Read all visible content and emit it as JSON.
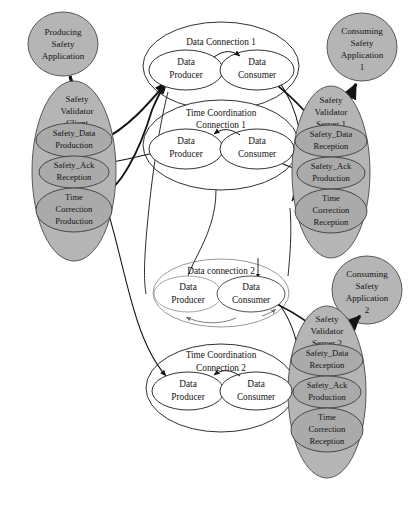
{
  "diagram": {
    "type": "node-link-diagram",
    "colors": {
      "app_fill": "#b5b5b5",
      "validator_fill": "#b5b5b5",
      "inner_fill": "#aaaaaa",
      "connection_fill": "#ffffff",
      "connection_stroke": "#1a1a1a",
      "light_stroke": "#9a9a9a",
      "arrow_stroke": "#141414",
      "background": "#ffffff"
    },
    "applications": [
      {
        "id": "producing-app",
        "lines": [
          "Producing",
          "Safety",
          "Application"
        ]
      },
      {
        "id": "consuming-app-1",
        "lines": [
          "Consuming",
          "Safety",
          "Application",
          "1"
        ]
      },
      {
        "id": "consuming-app-2",
        "lines": [
          "Consuming",
          "Safety",
          "Application",
          "2"
        ]
      }
    ],
    "validators": [
      {
        "id": "safety-validator-client",
        "lines": [
          "Safety",
          "Validator",
          "Client"
        ],
        "slots": [
          {
            "id": "safety-data-production",
            "lines": [
              "Safety_Data",
              "Production"
            ]
          },
          {
            "id": "safety-ack-reception",
            "lines": [
              "Safety_Ack",
              "Reception"
            ]
          },
          {
            "id": "time-correction-production",
            "lines": [
              "Time",
              "Correction",
              "Production"
            ]
          }
        ]
      },
      {
        "id": "safety-validator-server-1",
        "lines": [
          "Safety",
          "Validator",
          "Server 1"
        ],
        "slots": [
          {
            "id": "safety-data-reception-1",
            "lines": [
              "Safety_Data",
              "Reception"
            ]
          },
          {
            "id": "safety-ack-production-1",
            "lines": [
              "Safety_Ack",
              "Production"
            ]
          },
          {
            "id": "time-correction-reception-1",
            "lines": [
              "Time",
              "Correction",
              "Reception"
            ]
          }
        ]
      },
      {
        "id": "safety-validator-server-2",
        "lines": [
          "Safety",
          "Validator",
          "Server 2"
        ],
        "slots": [
          {
            "id": "safety-data-reception-2",
            "lines": [
              "Safety_Data",
              "Reception"
            ]
          },
          {
            "id": "safety-ack-production-2",
            "lines": [
              "Safety_Ack",
              "Production"
            ]
          },
          {
            "id": "time-correction-reception-2",
            "lines": [
              "Time",
              "Correction",
              "Reception"
            ]
          }
        ]
      }
    ],
    "connections": [
      {
        "id": "data-connection-1",
        "title_lines": [
          "Data Connection 1"
        ],
        "producer_lines": [
          "Data",
          "Producer"
        ],
        "consumer_lines": [
          "Data",
          "Consumer"
        ]
      },
      {
        "id": "time-coordination-connection-1",
        "title_lines": [
          "Time Coordination",
          "Connection 1"
        ],
        "producer_lines": [
          "Data",
          "Producer"
        ],
        "consumer_lines": [
          "Data",
          "Consumer"
        ]
      },
      {
        "id": "data-connection-2",
        "title_lines": [
          "Data connection 2"
        ],
        "producer_lines": [
          "Data",
          "Producer"
        ],
        "consumer_lines": [
          "Data",
          "Consumer"
        ]
      },
      {
        "id": "time-coordination-connection-2",
        "title_lines": [
          "Time Coordination",
          "Connection 2"
        ],
        "producer_lines": [
          "Data",
          "Producer"
        ],
        "consumer_lines": [
          "Data",
          "Consumer"
        ]
      }
    ],
    "labels": {
      "producing_app_l1": "Producing",
      "producing_app_l2": "Safety",
      "producing_app_l3": "Application",
      "consuming_app1_l1": "Consuming",
      "consuming_app1_l2": "Safety",
      "consuming_app1_l3": "Application",
      "consuming_app1_l4": "1",
      "consuming_app2_l1": "Consuming",
      "consuming_app2_l2": "Safety",
      "consuming_app2_l3": "Application",
      "consuming_app2_l4": "2",
      "svc_l1": "Safety",
      "svc_l2": "Validator",
      "svc_l3": "Client",
      "svc_s1_l1": "Safety_Data",
      "svc_s1_l2": "Production",
      "svc_s2_l1": "Safety_Ack",
      "svc_s2_l2": "Reception",
      "svc_s3_l1": "Time",
      "svc_s3_l2": "Correction",
      "svc_s3_l3": "Production",
      "svs1_l1": "Safety",
      "svs1_l2": "Validator",
      "svs1_l3": "Server 1",
      "svs1_s1_l1": "Safety_Data",
      "svs1_s1_l2": "Reception",
      "svs1_s2_l1": "Safety_Ack",
      "svs1_s2_l2": "Production",
      "svs1_s3_l1": "Time",
      "svs1_s3_l2": "Correction",
      "svs1_s3_l3": "Reception",
      "svs2_l1": "Safety",
      "svs2_l2": "Validator",
      "svs2_l3": "Server 2",
      "svs2_s1_l1": "Safety_Data",
      "svs2_s1_l2": "Reception",
      "svs2_s2_l1": "Safety_Ack",
      "svs2_s2_l2": "Production",
      "svs2_s3_l1": "Time",
      "svs2_s3_l2": "Correction",
      "svs2_s3_l3": "Reception",
      "dc1_title": "Data Connection 1",
      "dc1_prod_l1": "Data",
      "dc1_prod_l2": "Producer",
      "dc1_cons_l1": "Data",
      "dc1_cons_l2": "Consumer",
      "tcc1_title_l1": "Time Coordination",
      "tcc1_title_l2": "Connection 1",
      "tcc1_prod_l1": "Data",
      "tcc1_prod_l2": "Producer",
      "tcc1_cons_l1": "Data",
      "tcc1_cons_l2": "Consumer",
      "dc2_title": "Data connection 2",
      "dc2_prod_l1": "Data",
      "dc2_prod_l2": "Producer",
      "dc2_cons_l1": "Data",
      "dc2_cons_l2": "Consumer",
      "tcc2_title_l1": "Time Coordination",
      "tcc2_title_l2": "Connection 2",
      "tcc2_prod_l1": "Data",
      "tcc2_prod_l2": "Producer",
      "tcc2_cons_l1": "Data",
      "tcc2_cons_l2": "Consumer"
    }
  }
}
